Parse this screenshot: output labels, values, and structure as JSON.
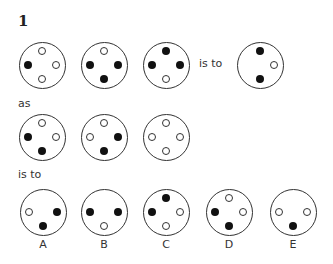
{
  "question": {
    "number": "1"
  },
  "text": {
    "is_to_1": "is to",
    "as": "as",
    "is_to_2": "is to"
  },
  "figures": {
    "row1": [
      {
        "cx": 42,
        "cy": 65,
        "dots": {
          "top": "open",
          "left": "filled",
          "right": "open",
          "bottom": "open"
        }
      },
      {
        "cx": 104,
        "cy": 65,
        "dots": {
          "top": "open",
          "left": "filled",
          "right": "filled",
          "bottom": "filled"
        }
      },
      {
        "cx": 166,
        "cy": 65,
        "dots": {
          "top": "filled",
          "left": "filled",
          "right": "filled",
          "bottom": "open"
        }
      },
      {
        "cx": 260,
        "cy": 65,
        "dots": {
          "top": "filled",
          "right": "open",
          "bottom": "filled"
        }
      }
    ],
    "row2": [
      {
        "cx": 42,
        "cy": 137,
        "dots": {
          "top": "open",
          "left": "filled",
          "right": "open",
          "bottom": "filled"
        }
      },
      {
        "cx": 104,
        "cy": 137,
        "dots": {
          "top": "open",
          "left": "open",
          "right": "filled",
          "bottom": "filled"
        }
      },
      {
        "cx": 166,
        "cy": 137,
        "dots": {
          "top": "open",
          "left": "open",
          "right": "open",
          "bottom": "open"
        }
      }
    ],
    "options": [
      {
        "label": "A",
        "cx": 43,
        "cy": 212,
        "dots": {
          "left": "open",
          "right": "filled",
          "bottom": "filled"
        }
      },
      {
        "label": "B",
        "cx": 104,
        "cy": 212,
        "dots": {
          "left": "filled",
          "right": "filled",
          "bottom": "open"
        }
      },
      {
        "label": "C",
        "cx": 166,
        "cy": 212,
        "dots": {
          "top": "filled",
          "left": "filled",
          "right": "open",
          "bottom": "open"
        }
      },
      {
        "label": "D",
        "cx": 229,
        "cy": 212,
        "dots": {
          "top": "open",
          "left": "filled",
          "right": "open",
          "bottom": "filled"
        }
      },
      {
        "label": "E",
        "cx": 293,
        "cy": 212,
        "dots": {
          "left": "open",
          "right": "open",
          "bottom": "filled"
        }
      }
    ]
  }
}
